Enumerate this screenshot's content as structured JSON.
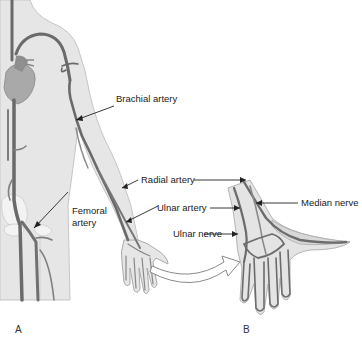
{
  "figure": {
    "panels": [
      {
        "id": "A",
        "label": "A",
        "description": "Full body arterial system, anterior view"
      },
      {
        "id": "B",
        "label": "B",
        "description": "Magnified view of wrist and hand"
      }
    ],
    "labels": {
      "brachial_artery": "Brachial artery",
      "femoral_artery_line1": "Femoral",
      "femoral_artery_line2": "artery",
      "radial_artery": "Radial artery",
      "ulnar_artery": "Ulnar artery",
      "ulnar_nerve": "Ulnar nerve",
      "median_nerve": "Median nerve"
    },
    "colors": {
      "skin": "#e4e4e4",
      "skin_outline": "#c8c8c8",
      "vessel": "#6e6e6e",
      "vessel_light": "#8a8a8a",
      "heart": "#a8a8a8",
      "bone": "#f2f2f2",
      "text": "#222222"
    }
  }
}
